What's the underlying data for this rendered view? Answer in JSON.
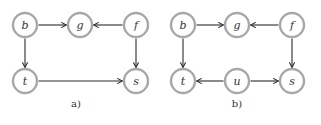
{
  "node_radius": 12,
  "colors": {
    "node_stroke": "#a8a8a8",
    "edge": "#2b2b2b",
    "text": "#333333"
  },
  "panels": [
    {
      "caption": "a)",
      "caption_pos": [
        76,
        107
      ],
      "nodes": [
        {
          "id": "b",
          "label": "b",
          "x": 25,
          "y": 25
        },
        {
          "id": "g",
          "label": "g",
          "x": 80,
          "y": 25
        },
        {
          "id": "f",
          "label": "f",
          "x": 136,
          "y": 25
        },
        {
          "id": "t",
          "label": "t",
          "x": 25,
          "y": 81
        },
        {
          "id": "s",
          "label": "s",
          "x": 136,
          "y": 81
        }
      ],
      "edges": [
        {
          "from": "b",
          "to": "g"
        },
        {
          "from": "f",
          "to": "g"
        },
        {
          "from": "b",
          "to": "t"
        },
        {
          "from": "f",
          "to": "s"
        },
        {
          "from": "t",
          "to": "s"
        }
      ]
    },
    {
      "caption": "b)",
      "caption_pos": [
        237,
        107
      ],
      "nodes": [
        {
          "id": "b",
          "label": "b",
          "x": 183,
          "y": 25
        },
        {
          "id": "g",
          "label": "g",
          "x": 237,
          "y": 25
        },
        {
          "id": "f",
          "label": "f",
          "x": 292,
          "y": 25
        },
        {
          "id": "t",
          "label": "t",
          "x": 183,
          "y": 81
        },
        {
          "id": "u",
          "label": "u",
          "x": 237,
          "y": 81
        },
        {
          "id": "s",
          "label": "s",
          "x": 292,
          "y": 81
        }
      ],
      "edges": [
        {
          "from": "b",
          "to": "g"
        },
        {
          "from": "f",
          "to": "g"
        },
        {
          "from": "b",
          "to": "t"
        },
        {
          "from": "f",
          "to": "s"
        },
        {
          "from": "u",
          "to": "t"
        },
        {
          "from": "u",
          "to": "s"
        }
      ]
    }
  ]
}
